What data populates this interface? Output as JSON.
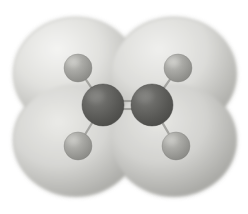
{
  "figure": {
    "kind": "molecular-model",
    "molecule_name": "Ethylene",
    "molecular_formula": "C2H4",
    "representation": "ball-and-stick inside translucent electron-density isosurface",
    "background_color": "#ffffff",
    "canvas": {
      "width": 248,
      "height": 214
    }
  },
  "palette": {
    "surface_light": "#e9e9e7",
    "surface_mid": "#cbcbc8",
    "surface_shadow": "#a9a9a5",
    "surface_edge": "#9b9b97",
    "carbon_dark": "#555553",
    "carbon_mid": "#6b6b68",
    "carbon_light": "#8a8a86",
    "hydrogen_dark": "#8d8d89",
    "hydrogen_mid": "#a2a29e",
    "hydrogen_light": "#bcbcb8",
    "bond_line": "#8e8e8a"
  },
  "atoms": [
    {
      "id": "C1",
      "element": "C",
      "label": "carbon-left",
      "cx": 103,
      "cy": 105,
      "r": 21,
      "shade": "dark"
    },
    {
      "id": "C2",
      "element": "C",
      "label": "carbon-right",
      "cx": 152,
      "cy": 105,
      "r": 21,
      "shade": "dark"
    },
    {
      "id": "H1",
      "element": "H",
      "label": "hydrogen-top-left",
      "cx": 78,
      "cy": 68,
      "r": 14,
      "shade": "light"
    },
    {
      "id": "H2",
      "element": "H",
      "label": "hydrogen-top-right",
      "cx": 178,
      "cy": 68,
      "r": 14,
      "shade": "light"
    },
    {
      "id": "H3",
      "element": "H",
      "label": "hydrogen-bottom-left",
      "cx": 78,
      "cy": 146,
      "r": 14,
      "shade": "light"
    },
    {
      "id": "H4",
      "element": "H",
      "label": "hydrogen-bottom-right",
      "cx": 176,
      "cy": 146,
      "r": 14,
      "shade": "light"
    }
  ],
  "bonds": [
    {
      "id": "b-C1C2",
      "label": "carbon-carbon-double-bond",
      "from": "C1",
      "to": "C2",
      "order": 2
    },
    {
      "id": "b-C1H1",
      "label": "bond-c1-h1",
      "from": "C1",
      "to": "H1",
      "order": 1
    },
    {
      "id": "b-C1H3",
      "label": "bond-c1-h3",
      "from": "C1",
      "to": "H3",
      "order": 1
    },
    {
      "id": "b-C2H2",
      "label": "bond-c2-h2",
      "from": "C2",
      "to": "H2",
      "order": 1
    },
    {
      "id": "b-C2H4",
      "label": "bond-c2-h4",
      "from": "C2",
      "to": "H4",
      "order": 1
    }
  ],
  "isosurface": {
    "label": "electron-density-isosurface",
    "lobes": [
      {
        "id": "lobe-top-left",
        "cx": 76,
        "cy": 74,
        "rx": 62,
        "ry": 56
      },
      {
        "id": "lobe-top-right",
        "cx": 174,
        "cy": 74,
        "rx": 62,
        "ry": 56
      },
      {
        "id": "lobe-bottom-left",
        "cx": 76,
        "cy": 140,
        "rx": 62,
        "ry": 56
      },
      {
        "id": "lobe-bottom-right",
        "cx": 174,
        "cy": 140,
        "rx": 62,
        "ry": 56
      },
      {
        "id": "lobe-center",
        "cx": 125,
        "cy": 107,
        "rx": 78,
        "ry": 48
      }
    ],
    "extent": {
      "left": 15,
      "right": 236,
      "top": 13,
      "bottom": 198
    },
    "notch_top": true,
    "notch_bottom": true
  },
  "lighting": {
    "key_light_direction": "upper-left",
    "highlight_center": {
      "x": 86,
      "y": 56
    }
  },
  "accessibility": {
    "alt_text": "Grayscale ball-and-stick model of ethylene (C2H4) enclosed in a translucent four-lobed electron density isosurface. Two large dark carbon spheres are joined by a double bond at center; four smaller lighter hydrogen spheres sit at the corners."
  }
}
